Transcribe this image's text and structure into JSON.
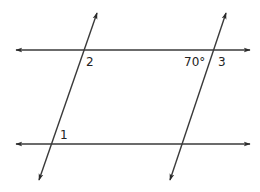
{
  "diagram": {
    "type": "geometry-parallel-lines-transversals",
    "line_color": "#3a3a3a",
    "background": "#ffffff",
    "horizontal_lines": [
      {
        "name": "top-line",
        "y": 50,
        "x1": 16,
        "x2": 250,
        "arrows": "both"
      },
      {
        "name": "bottom-line",
        "y": 144,
        "x1": 16,
        "x2": 250,
        "arrows": "both"
      }
    ],
    "transversals": [
      {
        "name": "left-transversal",
        "x1": 97,
        "y1": 13,
        "x2": 39,
        "y2": 180,
        "arrows": "both"
      },
      {
        "name": "right-transversal",
        "x1": 226,
        "y1": 13,
        "x2": 170,
        "y2": 180,
        "arrows": "both"
      }
    ],
    "labels": [
      {
        "name": "angle-2-label",
        "text": "2",
        "x": 86,
        "y": 56
      },
      {
        "name": "angle-70-label",
        "text": "70°",
        "x": 184,
        "y": 56
      },
      {
        "name": "angle-3-label",
        "text": "3",
        "x": 218,
        "y": 56
      },
      {
        "name": "angle-1-label",
        "text": "1",
        "x": 60,
        "y": 129
      }
    ]
  }
}
